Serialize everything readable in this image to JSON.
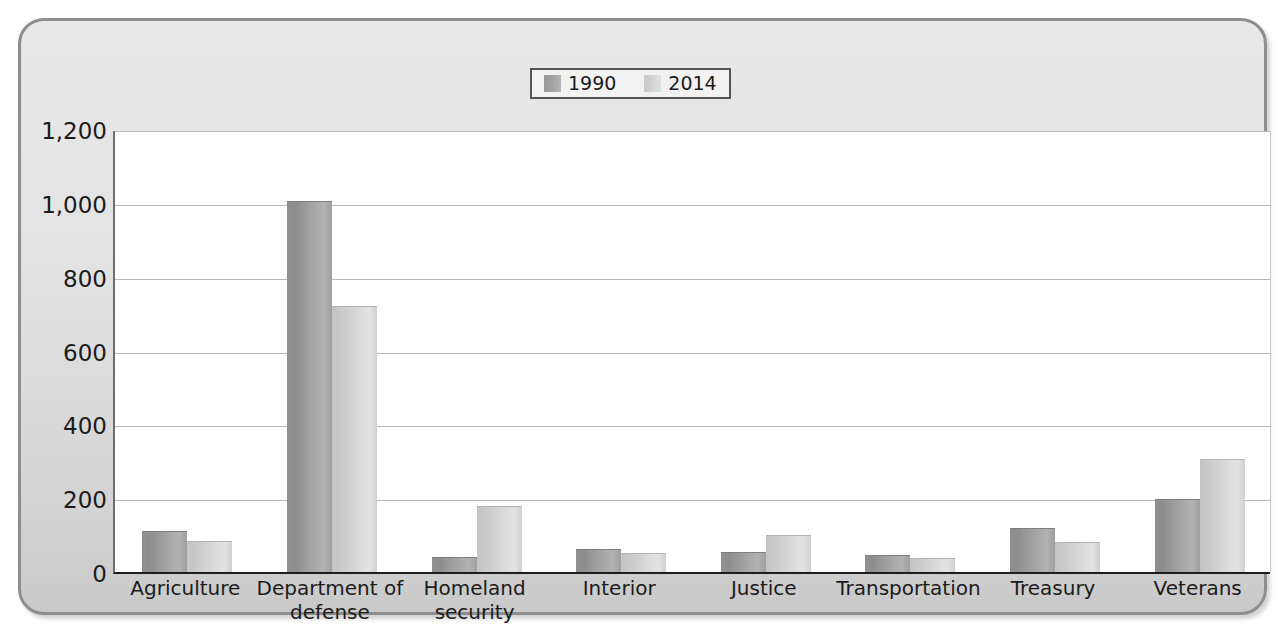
{
  "chart_data": {
    "type": "bar",
    "title": "",
    "xlabel": "",
    "ylabel": "",
    "ylim": [
      0,
      1200
    ],
    "yticks": [
      0,
      200,
      400,
      600,
      800,
      1000,
      1200
    ],
    "ytick_labels": [
      "0",
      "200",
      "400",
      "600",
      "800",
      "1,000",
      "1,200"
    ],
    "grid": true,
    "legend_position": "top-center",
    "categories": [
      "Agriculture",
      "Department of\ndefense",
      "Homeland\nsecurity",
      "Interior",
      "Justice",
      "Transportation",
      "Treasury",
      "Veterans"
    ],
    "series": [
      {
        "name": "1990",
        "color": "#9b9b9b",
        "values": [
          112,
          1005,
          40,
          62,
          55,
          45,
          118,
          197
        ]
      },
      {
        "name": "2014",
        "color": "#d4d4d4",
        "values": [
          85,
          720,
          178,
          52,
          100,
          38,
          82,
          307
        ]
      }
    ]
  },
  "legend": {
    "entries": [
      {
        "label": "1990"
      },
      {
        "label": "2014"
      }
    ]
  },
  "colors": {
    "bar_1990": "#9b9b9b",
    "bar_2014": "#d4d4d4",
    "panel_background": "#e0e0e0",
    "plot_background": "#ffffff",
    "gridline": "#b9b9b9",
    "axis": "#1d1d1d",
    "text": "#1b1b1b",
    "frame_border": "#8e8e8e"
  }
}
